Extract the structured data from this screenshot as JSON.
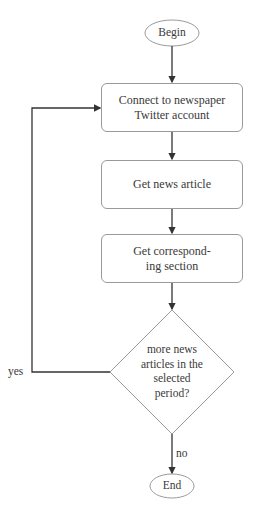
{
  "flowchart": {
    "start": {
      "label": "Begin"
    },
    "steps": [
      {
        "label": "Connect to newspaper Twitter account",
        "lines": [
          "Connect to newspaper",
          "Twitter account"
        ]
      },
      {
        "label": "Get news article",
        "lines": [
          "Get news article"
        ]
      },
      {
        "label": "Get corresponding section",
        "lines": [
          "Get correspond-",
          "ing section"
        ]
      }
    ],
    "decision": {
      "label": "more news articles in the selected period?",
      "lines": [
        "more news",
        "articles in the",
        "selected",
        "period?"
      ]
    },
    "yes_label": "yes",
    "no_label": "no",
    "end": {
      "label": "End"
    }
  }
}
